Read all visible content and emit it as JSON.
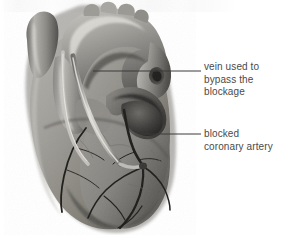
{
  "figure": {
    "style": "grayscale medical illustration",
    "width": 290,
    "height": 235,
    "background_color": "#ffffff"
  },
  "labels": [
    {
      "id": "vein-graft",
      "name": "vein-used-to-bypass-the-blockage-label",
      "lines": [
        "vein used to",
        "bypass the",
        "blockage"
      ],
      "text_color": "#4a4a4a",
      "leader": {
        "from_x": 93,
        "from_y": 71,
        "to_x": 201,
        "to_y": 71,
        "color": "#3a3a3a"
      }
    },
    {
      "id": "blocked-artery",
      "name": "blocked-coronary-artery-label",
      "lines": [
        "blocked",
        "coronary artery"
      ],
      "text_color": "#4a4a4a",
      "leader": {
        "from_x": 140,
        "from_y": 134,
        "to_x": 201,
        "to_y": 134,
        "color": "#3a3a3a"
      }
    }
  ],
  "anatomy": {
    "parts": [
      "aorta",
      "aortic arch",
      "superior vena cava",
      "pulmonary artery",
      "pulmonary trunk",
      "right atrium",
      "right ventricle",
      "left ventricle",
      "saphenous vein graft",
      "blocked coronary artery",
      "coronary artery branches"
    ],
    "palette": {
      "muscle_light": "#b9b7b3",
      "muscle_mid": "#8f8d89",
      "muscle_dark": "#636160",
      "muscle_deep": "#3c3b3a",
      "vessel_highlight": "#d8d6d1",
      "vessel_shadow": "#55534f",
      "artery_dark": "#24221f",
      "outline": "#2e2c2a"
    }
  }
}
